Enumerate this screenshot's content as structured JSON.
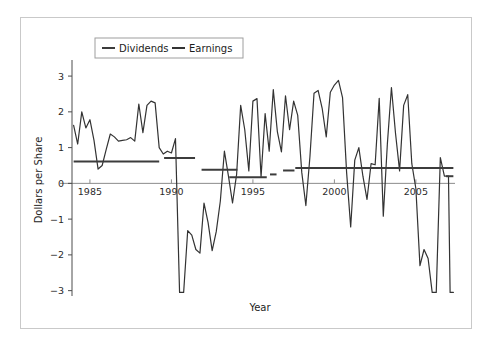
{
  "figure": {
    "border_color": "#c9c9c9",
    "background": "#ffffff"
  },
  "chart_data": {
    "type": "line",
    "title": "",
    "xlabel": "Year",
    "ylabel": "Dollars per Share",
    "xlim": [
      1983.9,
      2007.4
    ],
    "ylim": [
      -3.15,
      3.45
    ],
    "xticks": [
      1985,
      1990,
      1995,
      2000,
      2005
    ],
    "xticklabels": [
      "1985",
      "1990",
      "1995",
      "2000",
      "2005"
    ],
    "yticks": [
      -3,
      -2,
      -1,
      0,
      1,
      2,
      3
    ],
    "yticklabels": [
      "-3",
      "-2",
      "-1",
      "0",
      "1",
      "2",
      "3"
    ],
    "grid": false,
    "legend_position": "upper-left-inside",
    "zero_line": true,
    "zero_line_color": "#8c8c8c",
    "series": [
      {
        "name": "Earnings",
        "style": "line",
        "color": "#333333",
        "linewidth": 1.2,
        "x": [
          1984.0,
          1984.25,
          1984.5,
          1984.75,
          1985.0,
          1985.25,
          1985.5,
          1985.75,
          1986.0,
          1986.25,
          1986.5,
          1986.75,
          1987.0,
          1987.25,
          1987.5,
          1987.75,
          1988.0,
          1988.25,
          1988.5,
          1988.75,
          1989.0,
          1989.25,
          1989.5,
          1989.75,
          1990.0,
          1990.25,
          1990.5,
          1990.75,
          1991.0,
          1991.25,
          1991.5,
          1991.75,
          1992.0,
          1992.25,
          1992.5,
          1992.75,
          1993.0,
          1993.25,
          1993.5,
          1993.75,
          1994.0,
          1994.25,
          1994.5,
          1994.75,
          1995.0,
          1995.25,
          1995.5,
          1995.75,
          1996.0,
          1996.25,
          1996.5,
          1996.75,
          1997.0,
          1997.25,
          1997.5,
          1997.75,
          1998.0,
          1998.25,
          1998.5,
          1998.75,
          1999.0,
          1999.25,
          1999.5,
          1999.75,
          2000.0,
          2000.25,
          2000.5,
          2000.75,
          2001.0,
          2001.25,
          2001.5,
          2001.75,
          2002.0,
          2002.25,
          2002.5,
          2002.75,
          2003.0,
          2003.25,
          2003.5,
          2003.75,
          2004.0,
          2004.25,
          2004.5,
          2004.75,
          2005.0,
          2005.25,
          2005.5,
          2005.75,
          2006.0,
          2006.25,
          2006.5,
          2006.75,
          2007.0,
          2007.1,
          2007.2,
          2007.3
        ],
        "y": [
          1.62,
          1.1,
          2.0,
          1.55,
          1.78,
          1.2,
          0.4,
          0.5,
          0.95,
          1.38,
          1.3,
          1.18,
          1.2,
          1.22,
          1.28,
          1.18,
          2.22,
          1.42,
          2.18,
          2.3,
          2.25,
          1.0,
          0.82,
          0.9,
          0.85,
          1.25,
          -3.05,
          -3.05,
          -1.32,
          -1.45,
          -1.85,
          -1.95,
          -0.55,
          -1.1,
          -1.88,
          -1.35,
          -0.5,
          0.9,
          0.2,
          -0.55,
          0.25,
          2.18,
          1.5,
          0.35,
          2.3,
          2.37,
          0.18,
          1.95,
          0.9,
          2.62,
          1.45,
          0.88,
          2.45,
          1.5,
          2.3,
          1.9,
          0.3,
          -0.62,
          0.75,
          2.52,
          2.6,
          2.1,
          1.3,
          2.55,
          2.75,
          2.88,
          2.4,
          0.3,
          -1.22,
          0.65,
          1.0,
          0.2,
          -0.45,
          0.55,
          0.52,
          2.38,
          -0.92,
          1.1,
          2.68,
          1.4,
          0.35,
          2.18,
          2.48,
          0.55,
          -0.15,
          -2.3,
          -1.85,
          -2.1,
          -3.05,
          -3.05,
          0.72,
          0.2,
          0.2,
          -3.05,
          -3.05,
          -3.05
        ]
      },
      {
        "name": "Dividends",
        "style": "step-segments",
        "color": "#3c3c3c",
        "linewidth": 2.0,
        "segments": [
          {
            "x0": 1984.0,
            "x1": 1989.25,
            "y": 0.61
          },
          {
            "x0": 1989.55,
            "x1": 1991.45,
            "y": 0.71
          },
          {
            "x0": 1991.85,
            "x1": 1994.05,
            "y": 0.38
          },
          {
            "x0": 1993.55,
            "x1": 1995.85,
            "y": 0.17
          },
          {
            "x0": 1996.05,
            "x1": 1996.45,
            "y": 0.25
          },
          {
            "x0": 1996.85,
            "x1": 1997.55,
            "y": 0.36
          },
          {
            "x0": 1997.6,
            "x1": 2007.3,
            "y": 0.43
          },
          {
            "x0": 2006.85,
            "x1": 2007.3,
            "y": 0.2
          }
        ]
      }
    ],
    "legend": [
      {
        "label": "Dividends",
        "color": "#3c3c3c"
      },
      {
        "label": "Earnings",
        "color": "#333333"
      }
    ]
  }
}
